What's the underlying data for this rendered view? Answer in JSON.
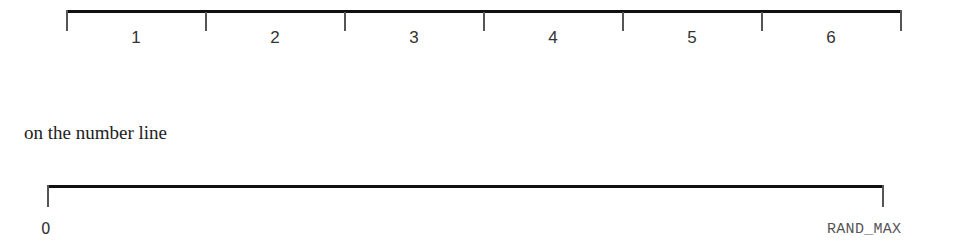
{
  "top_line": {
    "segments": [
      {
        "label": "1"
      },
      {
        "label": "2"
      },
      {
        "label": "3"
      },
      {
        "label": "4"
      },
      {
        "label": "5"
      },
      {
        "label": "6"
      }
    ]
  },
  "caption": "on the number line",
  "bottom_line": {
    "start_label": "0",
    "end_label": "RAND_MAX"
  },
  "colors": {
    "line": "#111111",
    "tick": "#555555",
    "text": "#333333"
  }
}
